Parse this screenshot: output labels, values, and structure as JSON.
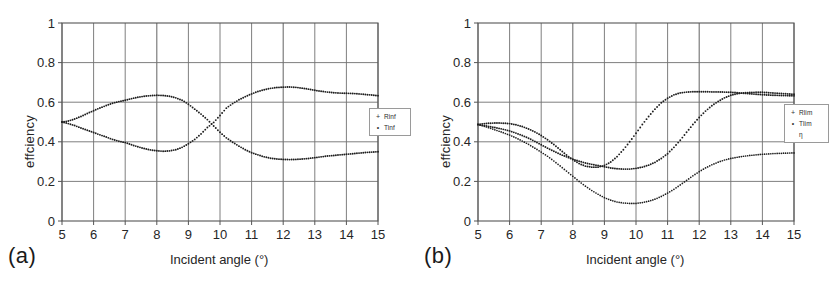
{
  "figure": {
    "panels": [
      {
        "tag": "(a)",
        "xlabel": "Incident angle (°)",
        "ylabel": "effciency",
        "legend": [
          {
            "name": "Rinf",
            "marker": "+"
          },
          {
            "name": "Tinf",
            "marker": "•"
          }
        ]
      },
      {
        "tag": "(b)",
        "xlabel": "Incident angle (°)",
        "ylabel": "effciency",
        "legend": [
          {
            "name": "Rlim",
            "marker": "+"
          },
          {
            "name": "Tlim",
            "marker": "•"
          },
          {
            "name": "η",
            "marker": ""
          }
        ]
      }
    ]
  },
  "chart_data": [
    {
      "type": "line",
      "title": "(a)",
      "xlabel": "Incident angle (°)",
      "ylabel": "effciency",
      "xlim": [
        5,
        15
      ],
      "ylim": [
        0,
        1
      ],
      "xticks": [
        5,
        6,
        7,
        8,
        9,
        10,
        11,
        12,
        13,
        14,
        15
      ],
      "yticks": [
        0,
        0.2,
        0.4,
        0.6,
        0.8,
        1
      ],
      "grid": true,
      "legend_position": "right-outside",
      "x": [
        5.0,
        5.2,
        5.4,
        5.6,
        5.8,
        6.0,
        6.2,
        6.4,
        6.6,
        6.8,
        7.0,
        7.2,
        7.4,
        7.6,
        7.8,
        8.0,
        8.2,
        8.4,
        8.6,
        8.8,
        9.0,
        9.2,
        9.4,
        9.6,
        9.8,
        10.0,
        10.2,
        10.4,
        10.6,
        10.8,
        11.0,
        11.2,
        11.4,
        11.6,
        11.8,
        12.0,
        12.2,
        12.4,
        12.6,
        12.8,
        13.0,
        13.2,
        13.4,
        13.6,
        13.8,
        14.0,
        14.2,
        14.4,
        14.6,
        14.8,
        15.0
      ],
      "series": [
        {
          "name": "Rinf",
          "marker": "+",
          "values": [
            0.5,
            0.505,
            0.515,
            0.528,
            0.543,
            0.557,
            0.571,
            0.583,
            0.595,
            0.603,
            0.61,
            0.618,
            0.625,
            0.63,
            0.633,
            0.635,
            0.634,
            0.63,
            0.622,
            0.61,
            0.59,
            0.565,
            0.54,
            0.512,
            0.48,
            0.448,
            0.42,
            0.398,
            0.378,
            0.36,
            0.345,
            0.334,
            0.324,
            0.317,
            0.313,
            0.311,
            0.31,
            0.311,
            0.313,
            0.316,
            0.32,
            0.324,
            0.328,
            0.331,
            0.334,
            0.337,
            0.34,
            0.343,
            0.346,
            0.348,
            0.35
          ]
        },
        {
          "name": "Tinf",
          "marker": "•",
          "values": [
            0.5,
            0.492,
            0.482,
            0.47,
            0.458,
            0.447,
            0.435,
            0.424,
            0.412,
            0.403,
            0.396,
            0.385,
            0.375,
            0.366,
            0.359,
            0.355,
            0.352,
            0.354,
            0.36,
            0.372,
            0.39,
            0.412,
            0.44,
            0.472,
            0.498,
            0.533,
            0.57,
            0.593,
            0.612,
            0.628,
            0.642,
            0.654,
            0.663,
            0.67,
            0.674,
            0.676,
            0.677,
            0.675,
            0.671,
            0.666,
            0.66,
            0.655,
            0.651,
            0.648,
            0.646,
            0.645,
            0.644,
            0.642,
            0.639,
            0.636,
            0.633
          ]
        }
      ]
    },
    {
      "type": "line",
      "title": "(b)",
      "xlabel": "Incident angle (°)",
      "ylabel": "effciency",
      "xlim": [
        5,
        15
      ],
      "ylim": [
        0,
        1
      ],
      "xticks": [
        5,
        6,
        7,
        8,
        9,
        10,
        11,
        12,
        13,
        14,
        15
      ],
      "yticks": [
        0,
        0.2,
        0.4,
        0.6,
        0.8,
        1
      ],
      "grid": true,
      "legend_position": "right-outside",
      "x": [
        5.0,
        5.2,
        5.4,
        5.6,
        5.8,
        6.0,
        6.2,
        6.4,
        6.6,
        6.8,
        7.0,
        7.2,
        7.4,
        7.6,
        7.8,
        8.0,
        8.2,
        8.4,
        8.6,
        8.8,
        9.0,
        9.2,
        9.4,
        9.6,
        9.8,
        10.0,
        10.2,
        10.4,
        10.6,
        10.8,
        11.0,
        11.2,
        11.4,
        11.6,
        11.8,
        12.0,
        12.2,
        12.4,
        12.6,
        12.8,
        13.0,
        13.2,
        13.4,
        13.6,
        13.8,
        14.0,
        14.2,
        14.4,
        14.6,
        14.8,
        15.0
      ],
      "series": [
        {
          "name": "Rlim",
          "marker": "+",
          "values": [
            0.488,
            0.492,
            0.494,
            0.495,
            0.494,
            0.492,
            0.486,
            0.477,
            0.465,
            0.45,
            0.432,
            0.41,
            0.386,
            0.36,
            0.333,
            0.31,
            0.29,
            0.277,
            0.272,
            0.272,
            0.28,
            0.298,
            0.325,
            0.36,
            0.4,
            0.443,
            0.487,
            0.528,
            0.565,
            0.597,
            0.62,
            0.637,
            0.647,
            0.651,
            0.653,
            0.653,
            0.653,
            0.652,
            0.652,
            0.651,
            0.65,
            0.648,
            0.645,
            0.643,
            0.64,
            0.638,
            0.636,
            0.635,
            0.634,
            0.633,
            0.632
          ]
        },
        {
          "name": "Tlim",
          "marker": "•",
          "values": [
            0.487,
            0.482,
            0.476,
            0.47,
            0.463,
            0.455,
            0.444,
            0.432,
            0.418,
            0.402,
            0.385,
            0.368,
            0.352,
            0.337,
            0.324,
            0.312,
            0.302,
            0.293,
            0.286,
            0.28,
            0.274,
            0.268,
            0.264,
            0.262,
            0.262,
            0.266,
            0.272,
            0.282,
            0.296,
            0.316,
            0.34,
            0.372,
            0.408,
            0.448,
            0.487,
            0.523,
            0.555,
            0.582,
            0.604,
            0.622,
            0.635,
            0.643,
            0.647,
            0.649,
            0.65,
            0.65,
            0.648,
            0.646,
            0.644,
            0.642,
            0.64
          ]
        },
        {
          "name": "η",
          "marker": "·",
          "values": [
            0.487,
            0.478,
            0.468,
            0.457,
            0.446,
            0.434,
            0.42,
            0.404,
            0.387,
            0.368,
            0.348,
            0.327,
            0.303,
            0.278,
            0.252,
            0.226,
            0.2,
            0.176,
            0.154,
            0.135,
            0.118,
            0.105,
            0.096,
            0.091,
            0.089,
            0.089,
            0.093,
            0.1,
            0.11,
            0.124,
            0.141,
            0.16,
            0.182,
            0.205,
            0.228,
            0.249,
            0.268,
            0.284,
            0.297,
            0.308,
            0.316,
            0.322,
            0.327,
            0.331,
            0.334,
            0.337,
            0.339,
            0.341,
            0.342,
            0.343,
            0.344
          ]
        }
      ]
    }
  ]
}
